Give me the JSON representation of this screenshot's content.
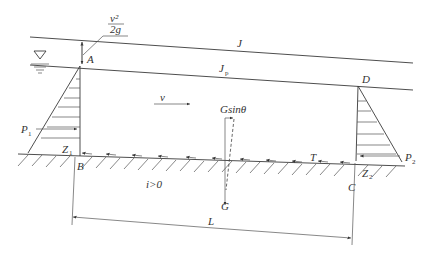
{
  "diagram": {
    "type": "open-channel uniform flow momentum diagram",
    "labels": {
      "energy_line": "J",
      "water_surface": "J",
      "water_surface_sub": "p",
      "velocity": "v",
      "velocity_head_num": "v²",
      "velocity_head_den": "2g",
      "gravity_component": "Gsinθ",
      "gravity": "G",
      "friction": "T",
      "pressure_left": "P",
      "pressure_left_sub": "1",
      "pressure_right": "P",
      "pressure_right_sub": "2",
      "elev_left": "Z",
      "elev_left_sub": "1",
      "elev_right": "Z",
      "elev_right_sub": "2",
      "point_a": "A",
      "point_b": "B",
      "point_c": "C",
      "point_d": "D",
      "slope": "i>0",
      "length": "L"
    },
    "colors": {
      "line": "#3a3a3a",
      "text": "#333333",
      "background": "#ffffff"
    }
  }
}
